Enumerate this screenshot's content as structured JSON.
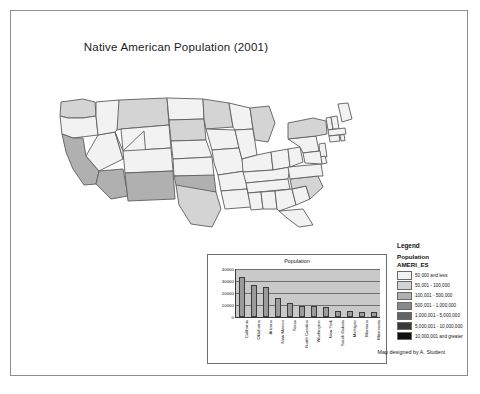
{
  "poster": {
    "title": "Native American Population (2001)",
    "credit": "Map designed by A. Student"
  },
  "legend": {
    "heading": "Legend",
    "subheading": "Population",
    "field": "AMERI_ES",
    "classes": [
      {
        "label": "50,000 and less",
        "color": "#f2f2f2"
      },
      {
        "label": "50,001 - 100,000",
        "color": "#d4d4d4"
      },
      {
        "label": "100,001 - 500,000",
        "color": "#b0b0b0"
      },
      {
        "label": "500,001 - 1,000,000",
        "color": "#8a8a8a"
      },
      {
        "label": "1,000,001 - 5,000,000",
        "color": "#636363"
      },
      {
        "label": "5,000,001 - 10,000,000",
        "color": "#3a3a3a"
      },
      {
        "label": "10,000,001 and greater",
        "color": "#101010"
      }
    ]
  },
  "chart_data": {
    "type": "bar",
    "title": "Population",
    "xlabel": "",
    "ylabel": "",
    "ylim": [
      0,
      40000
    ],
    "yticks": [
      0,
      10000,
      20000,
      30000,
      40000
    ],
    "ytick_labels": [
      "0",
      "10000",
      "20000",
      "30000",
      "40000"
    ],
    "grid": true,
    "legend": "none",
    "bar_color": "#9b9b9b",
    "plot_background": "#c9c9c9",
    "categories": [
      "California",
      "Oklahoma",
      "Arizona",
      "New Mexico",
      "Texas",
      "North Carolina",
      "Washington",
      "New York",
      "South Dakota",
      "Michigan",
      "Montana",
      "Minnesota"
    ],
    "values": [
      33500,
      26500,
      25000,
      16000,
      11500,
      9500,
      9500,
      8000,
      5000,
      5000,
      4500,
      4500
    ]
  },
  "map": {
    "shading_note": "choropleth of US states by Native American population",
    "states": [
      {
        "name": "Washington",
        "class": 2
      },
      {
        "name": "Oregon",
        "class": 1
      },
      {
        "name": "California",
        "class": 3
      },
      {
        "name": "Nevada",
        "class": 1
      },
      {
        "name": "Idaho",
        "class": 1
      },
      {
        "name": "Montana",
        "class": 2
      },
      {
        "name": "Wyoming",
        "class": 1
      },
      {
        "name": "Utah",
        "class": 1
      },
      {
        "name": "Arizona",
        "class": 3
      },
      {
        "name": "Colorado",
        "class": 1
      },
      {
        "name": "New Mexico",
        "class": 3
      },
      {
        "name": "North Dakota",
        "class": 1
      },
      {
        "name": "South Dakota",
        "class": 2
      },
      {
        "name": "Nebraska",
        "class": 1
      },
      {
        "name": "Kansas",
        "class": 1
      },
      {
        "name": "Oklahoma",
        "class": 3
      },
      {
        "name": "Texas",
        "class": 2
      },
      {
        "name": "Minnesota",
        "class": 2
      },
      {
        "name": "Iowa",
        "class": 1
      },
      {
        "name": "Missouri",
        "class": 1
      },
      {
        "name": "Arkansas",
        "class": 1
      },
      {
        "name": "Louisiana",
        "class": 1
      },
      {
        "name": "Wisconsin",
        "class": 1
      },
      {
        "name": "Illinois",
        "class": 1
      },
      {
        "name": "Michigan",
        "class": 2
      },
      {
        "name": "Indiana",
        "class": 1
      },
      {
        "name": "Ohio",
        "class": 1
      },
      {
        "name": "Kentucky",
        "class": 1
      },
      {
        "name": "Tennessee",
        "class": 1
      },
      {
        "name": "Mississippi",
        "class": 1
      },
      {
        "name": "Alabama",
        "class": 1
      },
      {
        "name": "Georgia",
        "class": 1
      },
      {
        "name": "Florida",
        "class": 1
      },
      {
        "name": "South Carolina",
        "class": 1
      },
      {
        "name": "North Carolina",
        "class": 2
      },
      {
        "name": "Virginia",
        "class": 1
      },
      {
        "name": "West Virginia",
        "class": 1
      },
      {
        "name": "Pennsylvania",
        "class": 1
      },
      {
        "name": "New York",
        "class": 2
      },
      {
        "name": "Maine",
        "class": 1
      },
      {
        "name": "Vermont",
        "class": 1
      },
      {
        "name": "New Hampshire",
        "class": 1
      },
      {
        "name": "Massachusetts",
        "class": 1
      },
      {
        "name": "Connecticut",
        "class": 1
      },
      {
        "name": "Rhode Island",
        "class": 1
      },
      {
        "name": "New Jersey",
        "class": 1
      },
      {
        "name": "Delaware",
        "class": 1
      },
      {
        "name": "Maryland",
        "class": 1
      }
    ]
  }
}
